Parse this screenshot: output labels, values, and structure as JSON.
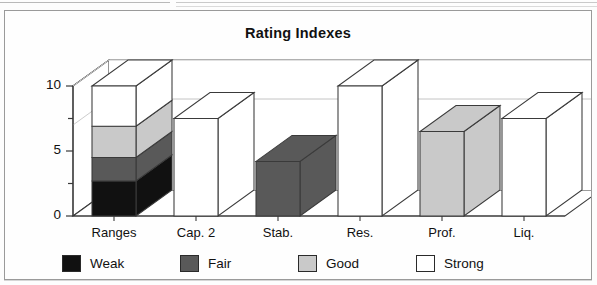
{
  "chart_data": {
    "type": "bar",
    "title": "Rating Indexes",
    "xlabel": "",
    "ylabel": "",
    "ylim": [
      0,
      10
    ],
    "yticks": [
      0,
      5,
      10
    ],
    "ytick_labels": [
      "0",
      "5",
      "10"
    ],
    "minor_yticks": [
      2.5,
      7.5
    ],
    "grid": true,
    "gridlines": [
      7,
      10
    ],
    "three_d": true,
    "stacked": true,
    "legend_position": "bottom",
    "categories": [
      "Ranges",
      "Cap. 2",
      "Stab.",
      "Res.",
      "Prof.",
      "Liq."
    ],
    "series": [
      {
        "name": "Weak",
        "color": "#111111",
        "values": [
          2.7,
          0,
          0,
          0,
          0,
          0
        ]
      },
      {
        "name": "Fair",
        "color": "#595959",
        "values": [
          1.8,
          0,
          4.2,
          0,
          0,
          0
        ]
      },
      {
        "name": "Good",
        "color": "#c9c9c9",
        "values": [
          2.4,
          0,
          0,
          0,
          6.5,
          0
        ]
      },
      {
        "name": "Strong",
        "color": "#ffffff",
        "values": [
          3.1,
          7.5,
          0,
          10,
          0,
          7.5
        ]
      }
    ],
    "totals": [
      10.0,
      7.5,
      4.2,
      10.0,
      6.5,
      7.5
    ],
    "annotations": []
  },
  "legend": {
    "items": [
      {
        "label": "Weak",
        "color": "#111111"
      },
      {
        "label": "Fair",
        "color": "#595959"
      },
      {
        "label": "Good",
        "color": "#c9c9c9"
      },
      {
        "label": "Strong",
        "color": "#ffffff"
      }
    ]
  },
  "axes": {
    "y_tick_labels": [
      "10",
      "5",
      "0"
    ],
    "x_tick_labels": [
      "Ranges",
      "Cap. 2",
      "Stab.",
      "Res.",
      "Prof.",
      "Liq."
    ]
  }
}
